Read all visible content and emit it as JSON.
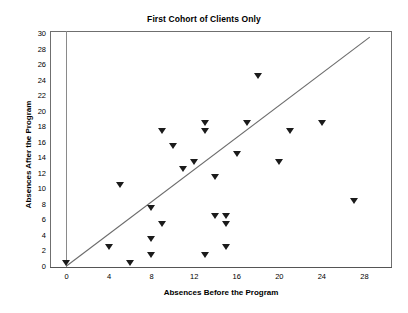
{
  "chart_data": {
    "type": "scatter",
    "title": "First Cohort of Clients Only",
    "xlabel": "Absences Before the Program",
    "ylabel": "Absences After the Program",
    "xlim": [
      0,
      30
    ],
    "ylim": [
      0,
      30
    ],
    "xticks": [
      0,
      4,
      8,
      12,
      16,
      20,
      24,
      28
    ],
    "yticks": [
      0,
      2,
      4,
      6,
      8,
      10,
      12,
      14,
      16,
      18,
      20,
      22,
      24,
      26,
      28,
      30
    ],
    "grid": false,
    "legend": null,
    "marker": "triangle-down",
    "marker_color": "#1b1b1b",
    "points": [
      {
        "x": 0,
        "y": 0
      },
      {
        "x": 4,
        "y": 2
      },
      {
        "x": 5,
        "y": 10
      },
      {
        "x": 6,
        "y": 0
      },
      {
        "x": 8,
        "y": 1
      },
      {
        "x": 8,
        "y": 3
      },
      {
        "x": 8,
        "y": 7
      },
      {
        "x": 9,
        "y": 5
      },
      {
        "x": 9,
        "y": 17
      },
      {
        "x": 10,
        "y": 15
      },
      {
        "x": 11,
        "y": 12
      },
      {
        "x": 12,
        "y": 13
      },
      {
        "x": 13,
        "y": 1
      },
      {
        "x": 13,
        "y": 18
      },
      {
        "x": 13,
        "y": 17
      },
      {
        "x": 14,
        "y": 11
      },
      {
        "x": 14,
        "y": 6
      },
      {
        "x": 15,
        "y": 5
      },
      {
        "x": 15,
        "y": 2
      },
      {
        "x": 15,
        "y": 6
      },
      {
        "x": 16,
        "y": 14
      },
      {
        "x": 17,
        "y": 18
      },
      {
        "x": 18,
        "y": 24
      },
      {
        "x": 20,
        "y": 13
      },
      {
        "x": 21,
        "y": 17
      },
      {
        "x": 24,
        "y": 18
      },
      {
        "x": 27,
        "y": 8
      }
    ],
    "trend_line": {
      "type": "linear-fit",
      "x_start": 0,
      "y_start": 0,
      "x_end": 28.5,
      "y_end": 29.5
    }
  }
}
